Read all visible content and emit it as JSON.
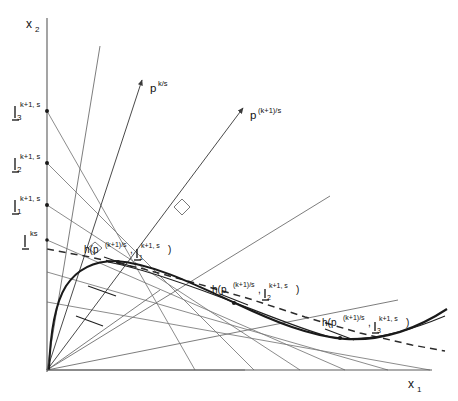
{
  "figure": {
    "title": "",
    "axes": {
      "x_label": "x",
      "x_label_sub": "1",
      "y_label": "x",
      "y_label_sub": "2",
      "origin_x": 47,
      "origin_y": 370,
      "x_axis_end": 432,
      "y_axis_top": 18
    },
    "price_rays": [
      {
        "name": "price-ray-k",
        "label_base": "p",
        "label_sup": "k/s",
        "label_x": 150,
        "label_y": 90,
        "from_x": 47,
        "from_y": 370,
        "to_x": 142,
        "to_y": 80
      },
      {
        "name": "price-ray-k-plus-1",
        "label_base": "p",
        "label_sup": "(k+1)/s",
        "label_x": 250,
        "label_y": 117,
        "from_x": 47,
        "from_y": 370,
        "to_x": 243,
        "to_y": 108
      }
    ],
    "lambda_ticks": [
      {
        "name": "lambda-3-k-plus-1",
        "symbol": "|",
        "sub": "3",
        "sup": "k+1, s",
        "axis_y": 111,
        "label_x": 16,
        "label_y": 112
      },
      {
        "name": "lambda-2-k-plus-1",
        "symbol": "|",
        "sub": "2",
        "sup": "k+1, s",
        "axis_y": 163,
        "label_x": 16,
        "label_y": 164
      },
      {
        "name": "lambda-1-k-plus-1",
        "symbol": "|",
        "sub": "1",
        "sup": "k+1, s",
        "axis_y": 205,
        "label_x": 16,
        "label_y": 206
      },
      {
        "name": "lambda-ks",
        "symbol": "|",
        "sub": "",
        "sup": "ks",
        "axis_y": 240,
        "label_x": 26,
        "label_y": 241
      }
    ],
    "solution_labels": [
      {
        "name": "h-solution-1",
        "prefix": "h(p",
        "sup1": "(k+1)/s",
        "mid": ", ",
        "lam": "|",
        "lam_sub": "1",
        "lam_sup": "k+1, s",
        "suffix": ")",
        "x": 107,
        "y": 252,
        "point_x": 120,
        "point_y": 265
      },
      {
        "name": "h-solution-2",
        "prefix": "h(p",
        "sup1": "(k+1)/s",
        "mid": ", ",
        "lam": "|",
        "lam_sub": "2",
        "lam_sup": "k+1, s",
        "suffix": ")",
        "x": 215,
        "y": 292,
        "point_x": 228,
        "point_y": 301
      },
      {
        "name": "h-solution-3",
        "prefix": "h(p",
        "sup1": "(k+1)/s",
        "mid": ", ",
        "lam": "|",
        "lam_sub": "3",
        "lam_sup": "k+1, s",
        "suffix": ")",
        "x": 325,
        "y": 325,
        "point_x": 334,
        "point_y": 336
      }
    ],
    "budget_lines": [
      {
        "name": "budget-line-1",
        "x1": 47,
        "y1": 111,
        "x2": 195,
        "y2": 370
      },
      {
        "name": "budget-line-2",
        "x1": 47,
        "y1": 163,
        "x2": 254,
        "y2": 370
      },
      {
        "name": "budget-line-3",
        "x1": 47,
        "y1": 205,
        "x2": 300,
        "y2": 370
      },
      {
        "name": "budget-line-4",
        "x1": 47,
        "y1": 240,
        "x2": 345,
        "y2": 370
      },
      {
        "name": "budget-line-5",
        "x1": 47,
        "y1": 272,
        "x2": 388,
        "y2": 370
      },
      {
        "name": "budget-line-6",
        "x1": 47,
        "y1": 302,
        "x2": 428,
        "y2": 370
      }
    ],
    "origin_rays": [
      {
        "name": "origin-ray-1",
        "x2": 97,
        "y2": 48
      },
      {
        "name": "origin-ray-2",
        "x2": 250,
        "y2": 107
      },
      {
        "name": "origin-ray-3",
        "x2": 330,
        "y2": 196
      },
      {
        "name": "origin-ray-4",
        "x2": 392,
        "y2": 298
      },
      {
        "name": "origin-ray-5",
        "x2": 240,
        "y2": 370
      }
    ],
    "perpendicular_marks": [
      {
        "name": "perp-mark-upper",
        "x": 181,
        "y": 212
      },
      {
        "name": "perp-mark-lower",
        "x": 95,
        "y": 247
      }
    ],
    "dashed_curve": {
      "name": "expansion-path-dashed",
      "points": "47,249 90,257 140,268 195,283 250,299 305,317 360,333 412,345 440,350"
    },
    "thick_curve": {
      "name": "demand-curve-thick",
      "points": "49,370 52,338 57,310 64,290 75,274 90,265 106,261 120,262 140,268 165,277 195,289 225,301 255,314 285,326 310,334 330,338 352,339 375,336 400,329 425,318 440,310"
    },
    "thin_curve": {
      "name": "demand-curve-thin",
      "points": "108,262 130,266 160,275 190,286 220,297 248,308 275,319 300,328 320,334 340,338 360,339 380,337 400,332 420,325 440,317"
    },
    "tangent_whiskers": [
      {
        "name": "whisker-1",
        "x1": 76,
        "y1": 312,
        "x2": 100,
        "y2": 322
      },
      {
        "name": "whisker-2",
        "x1": 88,
        "y1": 285,
        "x2": 112,
        "y2": 296
      },
      {
        "name": "whisker-3",
        "x1": 105,
        "y1": 258,
        "x2": 130,
        "y2": 267
      },
      {
        "name": "whisker-4",
        "x1": 222,
        "y1": 297,
        "x2": 246,
        "y2": 307
      },
      {
        "name": "whisker-5",
        "x1": 328,
        "y1": 332,
        "x2": 352,
        "y2": 341
      }
    ],
    "node_points": [
      {
        "name": "node-lambda-3",
        "x": 47,
        "y": 111
      },
      {
        "name": "node-lambda-2",
        "x": 47,
        "y": 163
      },
      {
        "name": "node-lambda-1",
        "x": 47,
        "y": 205
      },
      {
        "name": "node-lambda-ks",
        "x": 47,
        "y": 240
      }
    ]
  }
}
